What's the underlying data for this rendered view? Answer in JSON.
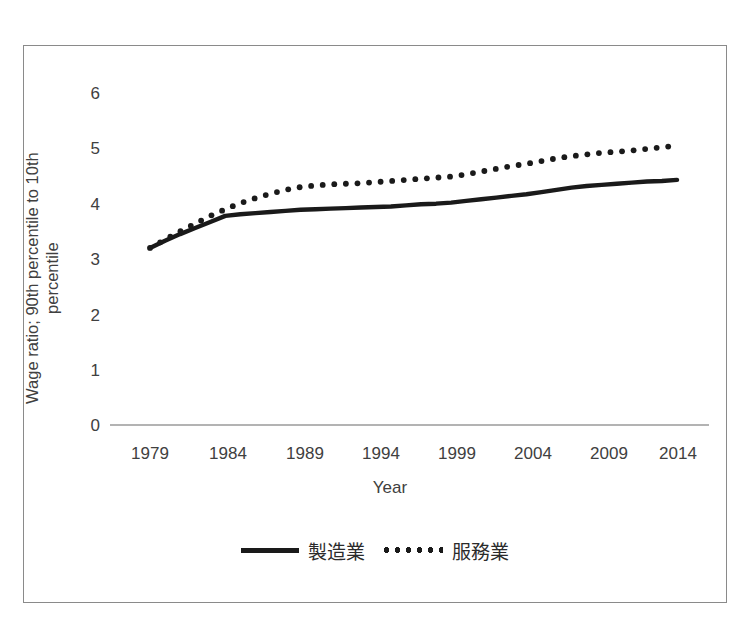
{
  "chart_data": {
    "type": "line",
    "title": "",
    "xlabel": "Year",
    "ylabel": "Wage ratio; 90th percentile to 10th percentile",
    "ylabel_line1": "Wage ratio; 90th percentile to 10th",
    "ylabel_line2": "percentile",
    "xlim": [
      1979,
      2014
    ],
    "ylim": [
      0,
      6
    ],
    "yticks": [
      "6",
      "5",
      "4",
      "3",
      "2",
      "1",
      "0"
    ],
    "ytick_values": [
      6,
      5,
      4,
      3,
      2,
      1,
      0
    ],
    "xticks": [
      "1979",
      "1984",
      "1989",
      "1994",
      "1999",
      "2004",
      "2009",
      "2014"
    ],
    "xtick_values": [
      1979,
      1984,
      1989,
      1994,
      1999,
      2004,
      2009,
      2014
    ],
    "grid": false,
    "legend_position": "bottom",
    "x": [
      1979,
      1980,
      1981,
      1982,
      1983,
      1984,
      1985,
      1986,
      1987,
      1988,
      1989,
      1990,
      1991,
      1992,
      1993,
      1994,
      1995,
      1996,
      1997,
      1998,
      1999,
      2000,
      2001,
      2002,
      2003,
      2004,
      2005,
      2006,
      2007,
      2008,
      2009,
      2010,
      2011,
      2012,
      2013,
      2014
    ],
    "series": [
      {
        "name": "製造業",
        "style": "solid",
        "color": "#1a1a1a",
        "values": [
          3.2,
          3.33,
          3.45,
          3.56,
          3.67,
          3.78,
          3.81,
          3.83,
          3.85,
          3.87,
          3.89,
          3.9,
          3.91,
          3.92,
          3.93,
          3.94,
          3.95,
          3.97,
          3.99,
          4.0,
          4.02,
          4.05,
          4.08,
          4.11,
          4.14,
          4.17,
          4.21,
          4.25,
          4.29,
          4.32,
          4.34,
          4.36,
          4.38,
          4.4,
          4.41,
          4.43
        ]
      },
      {
        "name": "服務業",
        "style": "dotted",
        "color": "#1a1a1a",
        "values": [
          3.2,
          3.35,
          3.5,
          3.64,
          3.78,
          3.9,
          4.01,
          4.1,
          4.18,
          4.25,
          4.3,
          4.33,
          4.35,
          4.36,
          4.37,
          4.39,
          4.41,
          4.43,
          4.45,
          4.47,
          4.49,
          4.53,
          4.58,
          4.63,
          4.68,
          4.72,
          4.77,
          4.82,
          4.86,
          4.89,
          4.92,
          4.94,
          4.96,
          4.99,
          5.02,
          5.05
        ]
      }
    ]
  },
  "legend": {
    "entries": [
      {
        "label": "製造業",
        "marker": "solid-line-swatch"
      },
      {
        "label": "服務業",
        "marker": "dotted-line-swatch"
      }
    ]
  }
}
